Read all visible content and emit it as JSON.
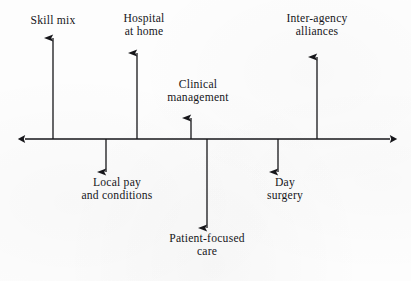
{
  "figure": {
    "background_color": "#fdfdfd",
    "stroke_color": "#16161a",
    "axis": {
      "orientation": "horizontal",
      "double_headed": true,
      "y": 139,
      "x_start": 25,
      "x_end": 390
    }
  },
  "nodes": [
    {
      "id": "skill-mix",
      "lines": [
        "Skill mix"
      ],
      "direction": "up",
      "axis_x": 53,
      "arrow_tip_y": 38,
      "label_x": 53,
      "label_y": 14
    },
    {
      "id": "hospital-at-home",
      "lines": [
        "Hospital",
        "at home"
      ],
      "direction": "up",
      "axis_x": 137,
      "arrow_tip_y": 53,
      "label_x": 144,
      "label_y": 12
    },
    {
      "id": "clinical-management",
      "lines": [
        "Clinical",
        "management"
      ],
      "direction": "up",
      "axis_x": 191,
      "arrow_tip_y": 118,
      "label_x": 198,
      "label_y": 78
    },
    {
      "id": "inter-agency-alliances",
      "lines": [
        "Inter-agency",
        "alliances"
      ],
      "direction": "up",
      "axis_x": 317,
      "arrow_tip_y": 57,
      "label_x": 317,
      "label_y": 12
    },
    {
      "id": "local-pay-and-conditions",
      "lines": [
        "Local pay",
        "and conditions"
      ],
      "direction": "down",
      "axis_x": 106,
      "arrow_tip_y": 172,
      "label_x": 117,
      "label_y": 176
    },
    {
      "id": "patient-focused-care",
      "lines": [
        "Patient-focused",
        "care"
      ],
      "direction": "down",
      "axis_x": 207,
      "arrow_tip_y": 228,
      "label_x": 207,
      "label_y": 232
    },
    {
      "id": "day-surgery",
      "lines": [
        "Day",
        "surgery"
      ],
      "direction": "down",
      "axis_x": 278,
      "arrow_tip_y": 172,
      "label_x": 285,
      "label_y": 176
    }
  ]
}
